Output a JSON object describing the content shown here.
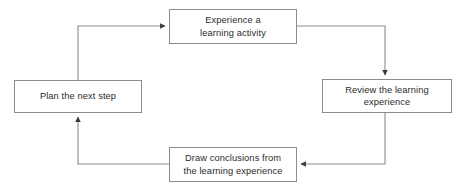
{
  "diagram": {
    "type": "cycle-flow",
    "direction": "clockwise",
    "colors": {
      "background": "#ffffff",
      "box_border": "#8c8c8c",
      "box_fill": "#ffffff",
      "connector_line": "#8c8c8c",
      "arrowhead": "#3a3a3a",
      "text": "#2b2b2b"
    },
    "nodes": [
      {
        "id": "experience",
        "label": "Experience a\nlearning activity",
        "line1": "Experience a",
        "line2": "learning activity",
        "position": "top"
      },
      {
        "id": "review",
        "label": "Review the learning\nexperience",
        "line1": "Review the learning",
        "line2": "experience",
        "position": "right"
      },
      {
        "id": "conclusions",
        "label": "Draw conclusions from\nthe learning experience",
        "line1": "Draw conclusions from",
        "line2": "the learning experience",
        "position": "bottom"
      },
      {
        "id": "plan",
        "label": "Plan the next step",
        "line1": "Plan the next step",
        "line2": "",
        "position": "left"
      }
    ],
    "edges": [
      {
        "id": "edge-experience-to-review",
        "from": "experience",
        "to": "review",
        "arrowhead": "down"
      },
      {
        "id": "edge-review-to-conclusions",
        "from": "review",
        "to": "conclusions",
        "arrowhead": "left"
      },
      {
        "id": "edge-conclusions-to-plan",
        "from": "conclusions",
        "to": "plan",
        "arrowhead": "up"
      },
      {
        "id": "edge-plan-to-experience",
        "from": "plan",
        "to": "experience",
        "arrowhead": "right"
      }
    ]
  }
}
